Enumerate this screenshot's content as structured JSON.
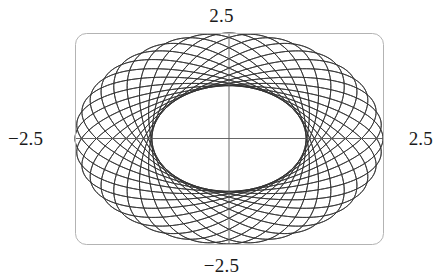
{
  "figure": {
    "title": "",
    "background_color": "#ffffff",
    "frame_color": "#b3b3b3",
    "curve_color": "#333333",
    "axis_color": "#555555"
  },
  "labels": {
    "top": "2.5",
    "bottom": "−2.5",
    "left": "−2.5",
    "right": "2.5"
  },
  "chart_data": {
    "type": "line",
    "title": "",
    "xlabel": "",
    "ylabel": "",
    "xlim": [
      -2.5,
      2.5
    ],
    "ylim": [
      -2.5,
      2.5
    ],
    "x_tick_labels": [
      "−2.5",
      "2.5"
    ],
    "y_tick_labels": [
      "−2.5",
      "2.5"
    ],
    "grid": false,
    "legend": null,
    "curve_family": {
      "kind": "rotated-ellipses",
      "count": 36,
      "semi_major_a": 2.5,
      "semi_minor_b": 1.25,
      "rotation_start_deg": 0,
      "rotation_step_deg": 10,
      "center": [
        0,
        0
      ],
      "aspect_ratio_x_over_y": 1.5
    },
    "axes_lines": [
      {
        "name": "x-axis",
        "from": [
          -2.5,
          0
        ],
        "to": [
          2.5,
          0
        ]
      },
      {
        "name": "y-axis",
        "from": [
          0,
          -2.5
        ],
        "to": [
          0,
          2.5
        ]
      }
    ],
    "frame": {
      "x_min_px": 75,
      "y_min_px": 33,
      "x_max_px": 383,
      "y_max_px": 244,
      "corner_radius_px": 11
    },
    "series": [
      {
        "name": "ellipse-00",
        "rotation_deg": 0
      },
      {
        "name": "ellipse-01",
        "rotation_deg": 10
      },
      {
        "name": "ellipse-02",
        "rotation_deg": 20
      },
      {
        "name": "ellipse-03",
        "rotation_deg": 30
      },
      {
        "name": "ellipse-04",
        "rotation_deg": 40
      },
      {
        "name": "ellipse-05",
        "rotation_deg": 50
      },
      {
        "name": "ellipse-06",
        "rotation_deg": 60
      },
      {
        "name": "ellipse-07",
        "rotation_deg": 70
      },
      {
        "name": "ellipse-08",
        "rotation_deg": 80
      },
      {
        "name": "ellipse-09",
        "rotation_deg": 90
      },
      {
        "name": "ellipse-10",
        "rotation_deg": 100
      },
      {
        "name": "ellipse-11",
        "rotation_deg": 110
      },
      {
        "name": "ellipse-12",
        "rotation_deg": 120
      },
      {
        "name": "ellipse-13",
        "rotation_deg": 130
      },
      {
        "name": "ellipse-14",
        "rotation_deg": 140
      },
      {
        "name": "ellipse-15",
        "rotation_deg": 150
      },
      {
        "name": "ellipse-16",
        "rotation_deg": 160
      },
      {
        "name": "ellipse-17",
        "rotation_deg": 170
      },
      {
        "name": "ellipse-18",
        "rotation_deg": 180
      },
      {
        "name": "ellipse-19",
        "rotation_deg": 190
      },
      {
        "name": "ellipse-20",
        "rotation_deg": 200
      },
      {
        "name": "ellipse-21",
        "rotation_deg": 210
      },
      {
        "name": "ellipse-22",
        "rotation_deg": 220
      },
      {
        "name": "ellipse-23",
        "rotation_deg": 230
      },
      {
        "name": "ellipse-24",
        "rotation_deg": 240
      },
      {
        "name": "ellipse-25",
        "rotation_deg": 250
      },
      {
        "name": "ellipse-26",
        "rotation_deg": 260
      },
      {
        "name": "ellipse-27",
        "rotation_deg": 270
      },
      {
        "name": "ellipse-28",
        "rotation_deg": 280
      },
      {
        "name": "ellipse-29",
        "rotation_deg": 290
      },
      {
        "name": "ellipse-30",
        "rotation_deg": 300
      },
      {
        "name": "ellipse-31",
        "rotation_deg": 310
      },
      {
        "name": "ellipse-32",
        "rotation_deg": 320
      },
      {
        "name": "ellipse-33",
        "rotation_deg": 330
      },
      {
        "name": "ellipse-34",
        "rotation_deg": 340
      },
      {
        "name": "ellipse-35",
        "rotation_deg": 350
      }
    ]
  }
}
